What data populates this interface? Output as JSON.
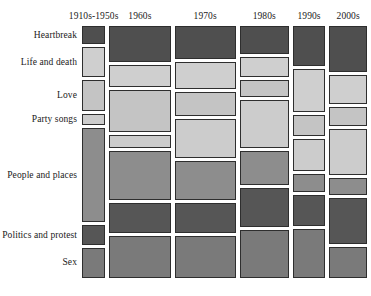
{
  "chart_data": {
    "type": "heatmap",
    "subtype": "mosaic",
    "title": "",
    "subtitle": "",
    "xlabel": "",
    "ylabel": "",
    "legend": "none",
    "grid": false,
    "note": "Mosaic (Marimekko) plot: column widths encode number of songs per decade; tile heights within a column encode the share of that decade's songs belonging to each theme; tile gray level encodes theme.",
    "columns": [
      {
        "label": "1910s-1950s",
        "width_frac": 0.088
      },
      {
        "label": "1960s",
        "width_frac": 0.231
      },
      {
        "label": "1970s",
        "width_frac": 0.231
      },
      {
        "label": "1980s",
        "width_frac": 0.185
      },
      {
        "label": "1990s",
        "width_frac": 0.123
      },
      {
        "label": "2000s",
        "width_frac": 0.142
      }
    ],
    "categories": [
      "Heartbreak",
      "Life and death",
      "Love",
      "Party songs",
      "People and places",
      "Politics and protest",
      "Sex"
    ],
    "category_colors": [
      "#4f4f4f",
      "#cfcfcf",
      "#c4c4c4",
      "#cccccc",
      "#8d8d8d",
      "#565656",
      "#7a7a7a"
    ],
    "series": [
      {
        "name": "1910s-1950s",
        "values": [
          0.078,
          0.128,
          0.132,
          0.046,
          0.404,
          0.083,
          0.129
        ]
      },
      {
        "name": "1960s",
        "values": [
          0.155,
          0.091,
          0.181,
          0.054,
          0.212,
          0.129,
          0.178
        ]
      },
      {
        "name": "1970s",
        "values": [
          0.142,
          0.115,
          0.104,
          0.164,
          0.168,
          0.127,
          0.18
        ]
      },
      {
        "name": "1980s",
        "values": [
          0.118,
          0.089,
          0.07,
          0.204,
          0.147,
          0.168,
          0.204
        ]
      },
      {
        "name": "1990s",
        "values": [
          0.17,
          0.185,
          0.09,
          0.136,
          0.075,
          0.133,
          0.211
        ]
      },
      {
        "name": "2000s",
        "values": [
          0.196,
          0.124,
          0.083,
          0.195,
          0.073,
          0.196,
          0.133
        ]
      }
    ],
    "ylim": [
      0,
      1
    ],
    "xlim": [
      0,
      1
    ]
  }
}
